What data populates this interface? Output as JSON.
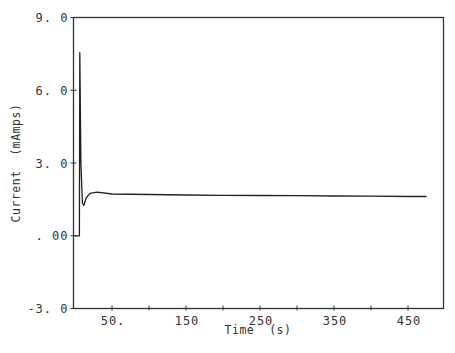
{
  "chart_data": {
    "type": "line",
    "title": "",
    "xlabel": "Time  (s)",
    "ylabel": "Current  (mAmps)",
    "xlim": [
      0,
      500
    ],
    "ylim": [
      -3.0,
      9.0
    ],
    "grid": false,
    "legend": null,
    "x_ticks": [
      50,
      100,
      150,
      200,
      250,
      300,
      350,
      400,
      450
    ],
    "x_tick_labels": [
      {
        "value": 50,
        "label": "50."
      },
      {
        "value": 150,
        "label": "150"
      },
      {
        "value": 250,
        "label": "250"
      },
      {
        "value": 350,
        "label": "350"
      },
      {
        "value": 450,
        "label": "450"
      }
    ],
    "y_ticks": [
      {
        "value": 9.0,
        "label": "9. 0"
      },
      {
        "value": 6.0,
        "label": "6. 0"
      },
      {
        "value": 3.0,
        "label": "3. 0"
      },
      {
        "value": 0.0,
        "label": ". 00"
      },
      {
        "value": -3.0,
        "label": "-3. 0"
      }
    ],
    "series": [
      {
        "name": "Current",
        "color": "#222222",
        "x": [
          0,
          6,
          6,
          6.5,
          8,
          10,
          12,
          15,
          20,
          30,
          50,
          100,
          150,
          200,
          250,
          300,
          350,
          400,
          450,
          475
        ],
        "y": [
          0.0,
          0.0,
          0.0,
          7.55,
          3.0,
          1.35,
          1.25,
          1.55,
          1.75,
          1.8,
          1.72,
          1.7,
          1.68,
          1.67,
          1.66,
          1.65,
          1.64,
          1.63,
          1.62,
          1.62
        ]
      }
    ]
  },
  "labels": {
    "x_axis_title": "Time  (s)",
    "y_axis_title": "Current  (mAmps)"
  }
}
